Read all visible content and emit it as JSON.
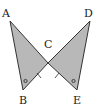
{
  "diagram": {
    "type": "geometry",
    "colors": {
      "fill": "#b8b8b8",
      "stroke": "#333333",
      "label": "#222222",
      "background": "#ffffff"
    },
    "points": {
      "A": {
        "label": "A",
        "x": 10,
        "y": 21
      },
      "B": {
        "label": "B",
        "x": 23,
        "y": 90
      },
      "C": {
        "label": "C",
        "x": 48,
        "y": 63
      },
      "D": {
        "label": "D",
        "x": 90,
        "y": 21
      },
      "E": {
        "label": "E",
        "x": 77,
        "y": 90
      }
    },
    "labels": {
      "A": "A",
      "B": "B",
      "C": "C",
      "D": "D",
      "E": "E"
    },
    "triangles": [
      {
        "name": "triangle-ABC",
        "vertices": [
          "A",
          "B",
          "C"
        ]
      },
      {
        "name": "triangle-DEC",
        "vertices": [
          "D",
          "E",
          "C"
        ]
      }
    ],
    "markings": {
      "equal_segments": [
        "CB",
        "CE"
      ],
      "equal_angles": [
        "B",
        "E"
      ]
    }
  }
}
